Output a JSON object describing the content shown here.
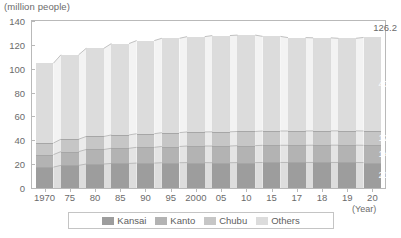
{
  "chart_data": {
    "type": "bar",
    "stacked": true,
    "title": "",
    "unit_label": "(million people)",
    "xlabel": "(Year)",
    "ylabel": "",
    "ylim": [
      0,
      140
    ],
    "ytick_labels": [
      "0",
      "20",
      "40",
      "60",
      "80",
      "100",
      "120",
      "140"
    ],
    "ytick_values": [
      0,
      20,
      40,
      60,
      80,
      100,
      120,
      140
    ],
    "grid": false,
    "legend_position": "bottom",
    "categories": [
      "1970",
      "75",
      "80",
      "85",
      "90",
      "95",
      "2000",
      "05",
      "10",
      "15",
      "17",
      "18",
      "19",
      "20"
    ],
    "series": [
      {
        "name": "Kansai",
        "color": "#9d9d9d",
        "values": [
          17.5,
          19.0,
          20.1,
          20.6,
          20.9,
          21.2,
          21.3,
          21.2,
          21.3,
          21.4,
          21.4,
          21.4,
          21.4,
          21.3
        ]
      },
      {
        "name": "Kanto",
        "color": "#b3b3b3",
        "values": [
          10.5,
          11.5,
          12.2,
          12.7,
          13.2,
          13.6,
          13.9,
          14.0,
          14.2,
          14.4,
          14.4,
          14.5,
          14.5,
          14.5
        ]
      },
      {
        "name": "Chubu",
        "color": "#c6c6c6",
        "values": [
          9.7,
          10.4,
          10.9,
          11.2,
          11.4,
          11.6,
          11.8,
          11.9,
          11.9,
          12.0,
          12.0,
          12.0,
          12.0,
          12.0
        ]
      },
      {
        "name": "Others",
        "color": "#dcdcdc",
        "values": [
          66.9,
          70.8,
          73.9,
          76.6,
          78.1,
          79.1,
          79.9,
          80.7,
          80.8,
          79.3,
          78.3,
          78.0,
          77.6,
          78.4
        ]
      }
    ],
    "totals": [
      104.6,
      111.7,
      117.1,
      121.1,
      123.6,
      125.5,
      126.9,
      127.8,
      128.2,
      127.1,
      126.1,
      125.9,
      125.5,
      126.2
    ],
    "end_labels": {
      "total": "126.2",
      "others": "43.4",
      "chubu": "12.0",
      "kanto": "14.5",
      "kansai": "21.3"
    }
  },
  "legend": {
    "items": [
      {
        "label": "Kansai",
        "color": "#9d9d9d"
      },
      {
        "label": "Kanto",
        "color": "#b3b3b3"
      },
      {
        "label": "Chubu",
        "color": "#c6c6c6"
      },
      {
        "label": "Others",
        "color": "#dcdcdc"
      }
    ]
  }
}
